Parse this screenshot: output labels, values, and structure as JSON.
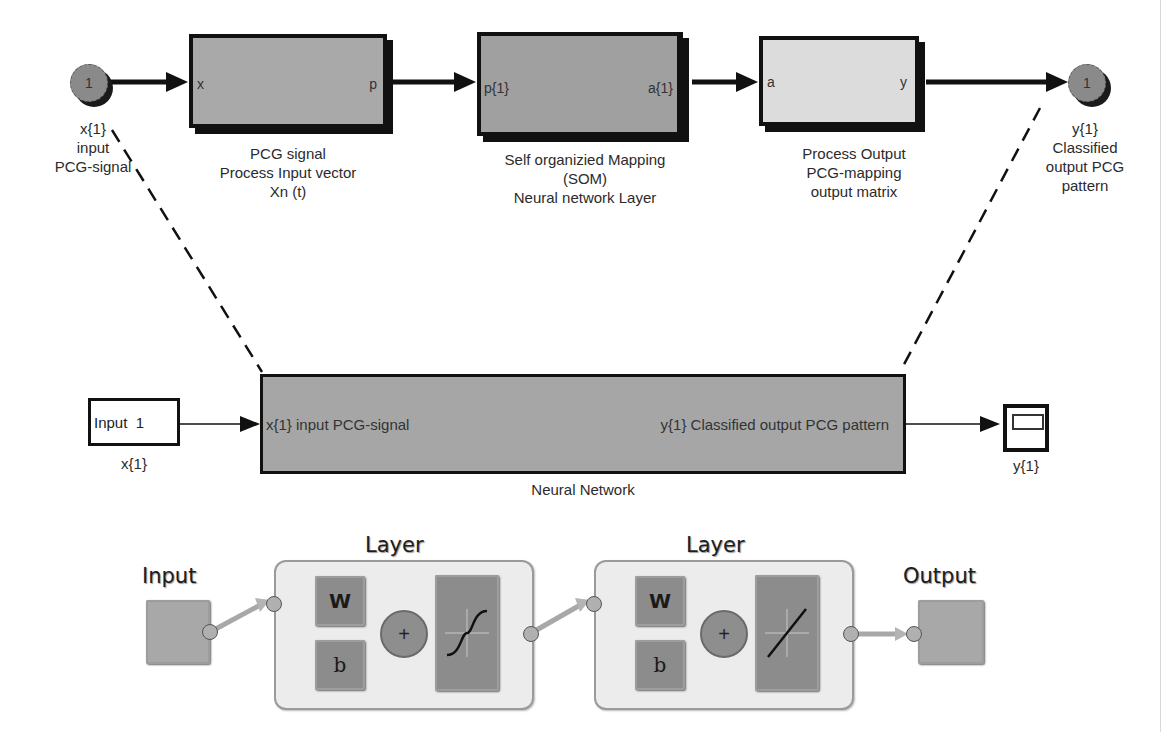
{
  "top_row": {
    "input_port": {
      "number": "1",
      "label_lines": [
        "x{1}",
        "input",
        "PCG-signal"
      ]
    },
    "process_input_block": {
      "in_port": "x",
      "out_port": "p",
      "caption_lines": [
        "PCG signal",
        "Process Input vector",
        "Xn (t)"
      ]
    },
    "som_block": {
      "in_port": "p{1}",
      "out_port": "a{1}",
      "caption_lines": [
        "Self organizied Mapping",
        "(SOM)",
        "Neural network Layer"
      ]
    },
    "process_output_block": {
      "in_port": "a",
      "out_port": "y",
      "caption_lines": [
        "Process Output",
        "PCG-mapping",
        "output matrix"
      ]
    },
    "output_port": {
      "number": "1",
      "label_lines": [
        "y{1}",
        "Classified",
        "output PCG",
        "pattern"
      ]
    }
  },
  "middle_row": {
    "input_block": {
      "text": "Input  1",
      "caption": "x{1}"
    },
    "neural_network_block": {
      "in_port": "x{1} input PCG-signal",
      "out_port": "y{1} Classified output PCG pattern",
      "caption": "Neural Network"
    },
    "scope_block": {
      "caption": "y{1}"
    }
  },
  "bottom_row": {
    "input_label": "Input",
    "output_label": "Output",
    "layers": [
      {
        "title": "Layer",
        "weight": "W",
        "bias": "b",
        "sum": "+",
        "transfer": "tansig"
      },
      {
        "title": "Layer",
        "weight": "W",
        "bias": "b",
        "sum": "+",
        "transfer": "purelin"
      }
    ]
  },
  "colors": {
    "block_gray": "#a9a9a9",
    "block_dark": "#8f8f8f",
    "block_light": "#d9d9d9",
    "border": "#111111",
    "layer_bg": "#ececec"
  }
}
